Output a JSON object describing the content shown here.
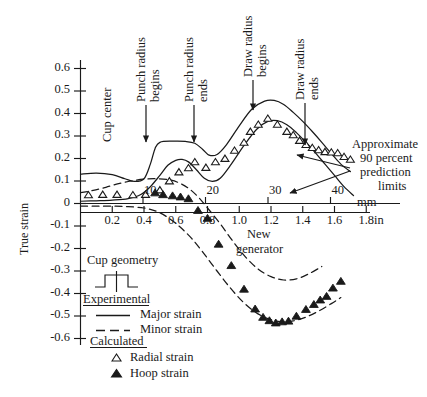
{
  "chart_data": {
    "type": "line",
    "title": "",
    "ylabel": "True strain",
    "xlabel_mm": "mm",
    "xlabel_in": "in",
    "ylim": [
      -0.65,
      0.68
    ],
    "yticks": [
      0.6,
      0.5,
      0.4,
      0.3,
      0.2,
      0.1,
      0,
      -0.1,
      -0.2,
      -0.3,
      -0.4,
      -0.5,
      -0.6
    ],
    "ytick_labels": [
      "0.6",
      "0.5",
      "0.4",
      "0.3",
      "0.2",
      "0.1",
      "0",
      "-0.1",
      "-0.2",
      "-0.3",
      "-0.4",
      "-0.5",
      "-0.6"
    ],
    "xlim_mm": [
      0,
      46
    ],
    "xticks_mm": [
      10,
      20,
      30,
      40
    ],
    "xtick_labels_mm": [
      "10",
      "20",
      "30",
      "40"
    ],
    "xlim_in": [
      0,
      1.81
    ],
    "xticks_in": [
      0.2,
      0.4,
      0.6,
      0.8,
      1.0,
      1.2,
      1.4,
      1.6,
      1.8
    ],
    "xtick_labels_in": [
      "0.2",
      "0.4",
      "0.6",
      "0.8",
      "1.0",
      "1.2",
      "1.4",
      "1.6",
      "1.8"
    ],
    "grid": false,
    "legend_position": "lower-left",
    "series": [
      {
        "name": "Major strain",
        "style": "solid",
        "role": "experimental-upper-limit",
        "points_in": [
          [
            0.0,
            0.13
          ],
          [
            0.1,
            0.135
          ],
          [
            0.2,
            0.128
          ],
          [
            0.28,
            0.11
          ],
          [
            0.34,
            0.098
          ],
          [
            0.4,
            0.11
          ],
          [
            0.44,
            0.175
          ],
          [
            0.47,
            0.245
          ],
          [
            0.5,
            0.272
          ],
          [
            0.58,
            0.277
          ],
          [
            0.66,
            0.276
          ],
          [
            0.72,
            0.268
          ],
          [
            0.77,
            0.24
          ],
          [
            0.81,
            0.215
          ],
          [
            0.86,
            0.218
          ],
          [
            0.92,
            0.262
          ],
          [
            1.0,
            0.345
          ],
          [
            1.08,
            0.42
          ],
          [
            1.16,
            0.455
          ],
          [
            1.22,
            0.458
          ],
          [
            1.28,
            0.44
          ],
          [
            1.34,
            0.405
          ],
          [
            1.4,
            0.365
          ],
          [
            1.46,
            0.32
          ],
          [
            1.52,
            0.272
          ],
          [
            1.58,
            0.222
          ],
          [
            1.64,
            0.175
          ],
          [
            1.7,
            0.142
          ]
        ]
      },
      {
        "name": "Major strain lower limit",
        "style": "solid",
        "role": "experimental-lower-limit",
        "points_in": [
          [
            0.0,
            0.01
          ],
          [
            0.1,
            0.012
          ],
          [
            0.2,
            0.015
          ],
          [
            0.3,
            0.022
          ],
          [
            0.38,
            0.04
          ],
          [
            0.44,
            0.075
          ],
          [
            0.5,
            0.125
          ],
          [
            0.55,
            0.17
          ],
          [
            0.6,
            0.192
          ],
          [
            0.64,
            0.196
          ],
          [
            0.68,
            0.185
          ],
          [
            0.73,
            0.15
          ],
          [
            0.78,
            0.112
          ],
          [
            0.83,
            0.098
          ],
          [
            0.88,
            0.112
          ],
          [
            0.95,
            0.175
          ],
          [
            1.03,
            0.258
          ],
          [
            1.11,
            0.33
          ],
          [
            1.18,
            0.365
          ],
          [
            1.24,
            0.368
          ],
          [
            1.3,
            0.35
          ],
          [
            1.36,
            0.315
          ],
          [
            1.42,
            0.272
          ],
          [
            1.48,
            0.225
          ],
          [
            1.54,
            0.175
          ],
          [
            1.6,
            0.125
          ],
          [
            1.66,
            0.075
          ],
          [
            1.72,
            0.035
          ]
        ]
      },
      {
        "name": "Minor strain",
        "style": "dashed",
        "role": "minor-upper-limit",
        "points_in": [
          [
            0.0,
            0.048
          ],
          [
            0.08,
            0.058
          ],
          [
            0.16,
            0.072
          ],
          [
            0.24,
            0.088
          ],
          [
            0.32,
            0.1
          ],
          [
            0.4,
            0.108
          ],
          [
            0.48,
            0.11
          ],
          [
            0.56,
            0.105
          ],
          [
            0.62,
            0.092
          ],
          [
            0.68,
            0.068
          ],
          [
            0.74,
            0.03
          ],
          [
            0.8,
            -0.02
          ],
          [
            0.88,
            -0.09
          ],
          [
            0.96,
            -0.168
          ],
          [
            1.04,
            -0.238
          ],
          [
            1.12,
            -0.292
          ],
          [
            1.2,
            -0.325
          ],
          [
            1.28,
            -0.34
          ],
          [
            1.36,
            -0.335
          ],
          [
            1.44,
            -0.312
          ],
          [
            1.52,
            -0.28
          ]
        ]
      },
      {
        "name": "Minor strain lower limit",
        "style": "dashed",
        "role": "minor-lower-limit",
        "points_in": [
          [
            0.0,
            -0.012
          ],
          [
            0.1,
            -0.012
          ],
          [
            0.2,
            -0.012
          ],
          [
            0.3,
            -0.014
          ],
          [
            0.4,
            -0.02
          ],
          [
            0.48,
            -0.035
          ],
          [
            0.55,
            -0.062
          ],
          [
            0.62,
            -0.1
          ],
          [
            0.7,
            -0.155
          ],
          [
            0.78,
            -0.225
          ],
          [
            0.86,
            -0.3
          ],
          [
            0.94,
            -0.372
          ],
          [
            1.02,
            -0.435
          ],
          [
            1.1,
            -0.482
          ],
          [
            1.18,
            -0.512
          ],
          [
            1.26,
            -0.525
          ],
          [
            1.34,
            -0.522
          ],
          [
            1.42,
            -0.505
          ],
          [
            1.5,
            -0.478
          ],
          [
            1.58,
            -0.445
          ],
          [
            1.64,
            -0.418
          ]
        ]
      }
    ],
    "scatter": [
      {
        "name": "Radial strain",
        "marker": "open-triangle",
        "points_in": [
          [
            0.05,
            0.038
          ],
          [
            0.14,
            0.04
          ],
          [
            0.23,
            0.04
          ],
          [
            0.33,
            0.038
          ],
          [
            0.41,
            0.04
          ],
          [
            0.5,
            0.06
          ],
          [
            0.56,
            0.1
          ],
          [
            0.62,
            0.14
          ],
          [
            0.68,
            0.158
          ],
          [
            0.72,
            0.185
          ],
          [
            0.79,
            0.16
          ],
          [
            0.85,
            0.185
          ],
          [
            0.91,
            0.2
          ],
          [
            0.97,
            0.236
          ],
          [
            1.03,
            0.272
          ],
          [
            1.07,
            0.32
          ],
          [
            1.12,
            0.352
          ],
          [
            1.18,
            0.378
          ],
          [
            1.24,
            0.352
          ],
          [
            1.3,
            0.32
          ],
          [
            1.34,
            0.305
          ],
          [
            1.38,
            0.28
          ],
          [
            1.42,
            0.262
          ],
          [
            1.46,
            0.248
          ],
          [
            1.5,
            0.238
          ],
          [
            1.54,
            0.23
          ],
          [
            1.58,
            0.228
          ],
          [
            1.62,
            0.225
          ],
          [
            1.66,
            0.208
          ],
          [
            1.7,
            0.196
          ]
        ]
      },
      {
        "name": "Hoop strain",
        "marker": "filled-triangle",
        "points_in": [
          [
            0.47,
            0.048
          ],
          [
            0.52,
            0.04
          ],
          [
            0.58,
            0.035
          ],
          [
            0.63,
            0.03
          ],
          [
            0.68,
            0.022
          ],
          [
            0.74,
            -0.03
          ],
          [
            0.8,
            -0.065
          ],
          [
            0.87,
            -0.18
          ],
          [
            0.95,
            -0.275
          ],
          [
            1.03,
            -0.38
          ],
          [
            1.1,
            -0.468
          ],
          [
            1.15,
            -0.505
          ],
          [
            1.19,
            -0.52
          ],
          [
            1.23,
            -0.53
          ],
          [
            1.27,
            -0.525
          ],
          [
            1.31,
            -0.522
          ],
          [
            1.36,
            -0.5
          ],
          [
            1.42,
            -0.47
          ],
          [
            1.47,
            -0.448
          ],
          [
            1.51,
            -0.428
          ],
          [
            1.55,
            -0.412
          ],
          [
            1.59,
            -0.375
          ],
          [
            1.64,
            -0.345
          ]
        ]
      }
    ],
    "annotations": [
      {
        "id": "cup-center",
        "text": "Cup center",
        "orientation": "vertical"
      },
      {
        "id": "punch-radius-begins",
        "text": "Punch radius\nbegins",
        "line1": "Punch radius",
        "line2": "begins",
        "orientation": "vertical",
        "arrow": true
      },
      {
        "id": "punch-radius-ends",
        "text": "Punch radius\nends",
        "line1": "Punch radius",
        "line2": "ends",
        "orientation": "vertical",
        "arrow": true
      },
      {
        "id": "draw-radius-begins",
        "text": "Draw radius\nbegins",
        "line1": "Draw radius",
        "line2": "begins",
        "orientation": "vertical",
        "arrow": true
      },
      {
        "id": "draw-radius-ends",
        "text": "Draw radius\nends",
        "line1": "Draw radius",
        "line2": "ends",
        "orientation": "vertical",
        "arrow": true
      },
      {
        "id": "prediction-limits",
        "line1": "Approximate",
        "line2": "90 percent",
        "line3": "prediction",
        "line4": "limits",
        "orientation": "horizontal",
        "arrow": true
      },
      {
        "id": "new-generator",
        "line1": "New",
        "line2": "generator",
        "orientation": "horizontal"
      }
    ]
  },
  "legend": {
    "cup_geometry_title": "Cup geometry",
    "experimental_heading": "Experimental",
    "calculated_heading": "Calculated",
    "entries": [
      {
        "label": "Major strain",
        "style": "solid-line"
      },
      {
        "label": "Minor strain",
        "style": "dashed-line"
      },
      {
        "label": "Radial strain",
        "style": "open-triangle"
      },
      {
        "label": "Hoop strain",
        "style": "filled-triangle"
      }
    ]
  },
  "colors": {
    "ink": "#1a1a1a",
    "background": "#ffffff"
  }
}
